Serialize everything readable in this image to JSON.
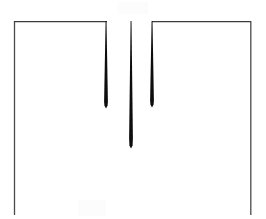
{
  "chart_data": {
    "type": "line",
    "title": "",
    "subtitle": "",
    "xlabel": "",
    "ylabel": "",
    "xlim": [
      0,
      266
    ],
    "ylim": [
      0,
      1.05
    ],
    "grid": false,
    "legend": null,
    "legend_position": "none",
    "annotations": [],
    "tick_labels": {
      "x": [],
      "y": []
    },
    "baseline_level": 1.0,
    "series": [
      {
        "name": "signal",
        "color": "#1a1a1a",
        "x": [
          14,
          106,
          106,
          106,
          131,
          131,
          131,
          152,
          152,
          152,
          251
        ],
        "values": [
          1.0,
          1.0,
          0.55,
          1.0,
          1.0,
          0.34,
          1.0,
          1.0,
          0.56,
          1.0,
          1.0
        ]
      }
    ],
    "spikes": [
      {
        "index": 1,
        "x_px": 106,
        "depth_px": 87,
        "tip_y_px": 108,
        "depth_norm": 0.45,
        "width_px": 4
      },
      {
        "index": 2,
        "x_px": 131,
        "depth_px": 127,
        "tip_y_px": 148,
        "depth_norm": 0.66,
        "width_px": 4
      },
      {
        "index": 3,
        "x_px": 152,
        "depth_px": 86,
        "tip_y_px": 107,
        "depth_norm": 0.44,
        "width_px": 4
      }
    ],
    "frame": {
      "left_x_px": 14,
      "right_x_px": 251,
      "top_y_px": 21,
      "bottom_y_px": 215,
      "top_gap_from_px": 107,
      "top_gap_to_px": 152
    },
    "colors": {
      "background": "#ffffff",
      "frame_line": "#4a4a4a",
      "spike": "#0d0d0d",
      "baseline": "#3c3c3c"
    }
  }
}
